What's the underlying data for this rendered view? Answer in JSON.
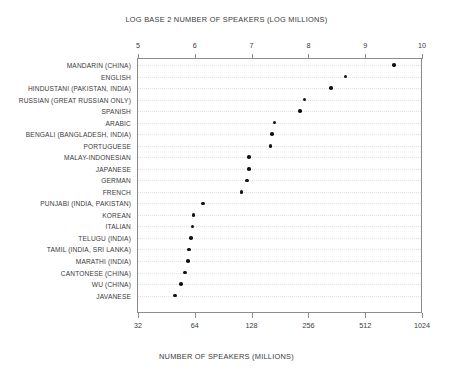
{
  "chart_data": {
    "type": "scatter",
    "title": "LOG BASE 2 NUMBER OF SPEAKERS (LOG MILLIONS)",
    "xlabel_bottom": "NUMBER OF SPEAKERS  (MILLIONS)",
    "xlabel_top": "LOG BASE 2 NUMBER OF SPEAKERS (LOG MILLIONS)",
    "ylabel": "",
    "grid": true,
    "legend": "none",
    "xlim": [
      5,
      10
    ],
    "top_axis": {
      "ticks": [
        5,
        6,
        7,
        8,
        9,
        10
      ],
      "tick_labels": [
        "5",
        "6",
        "7",
        "8",
        "9",
        "10"
      ]
    },
    "bottom_axis": {
      "ticks": [
        5,
        6,
        7,
        8,
        9,
        10
      ],
      "tick_labels": [
        "32",
        "64",
        "128",
        "256",
        "512",
        "1024"
      ]
    },
    "categories": [
      "MANDARIN (CHINA)",
      "ENGLISH",
      "HINDUSTANI (PAKISTAN, INDIA)",
      "RUSSIAN (GREAT RUSSIAN ONLY)",
      "SPANISH",
      "ARABIC",
      "BENGALI (BANGLADESH, INDIA)",
      "PORTUGUESE",
      "MALAY-INDONESIAN",
      "JAPANESE",
      "GERMAN",
      "FRENCH",
      "PUNJABI (INDIA, PAKISTAN)",
      "KOREAN",
      "ITALIAN",
      "TELUGU (INDIA)",
      "TAMIL (INDIA, SRI LANKA)",
      "MARATHI (INDIA)",
      "CANTONESE (CHINA)",
      "WU (CHINA)",
      "JAVANESE"
    ],
    "values": [
      9.51,
      8.65,
      8.4,
      7.93,
      7.85,
      7.4,
      7.36,
      7.33,
      6.95,
      6.95,
      6.92,
      6.82,
      6.14,
      5.98,
      5.96,
      5.93,
      5.9,
      5.88,
      5.83,
      5.76,
      5.65
    ],
    "values_millions": [
      728,
      402,
      338,
      244,
      231,
      169,
      164,
      161,
      124,
      124,
      121,
      113,
      71,
      63,
      62,
      61,
      60,
      59,
      57,
      54,
      50
    ]
  }
}
